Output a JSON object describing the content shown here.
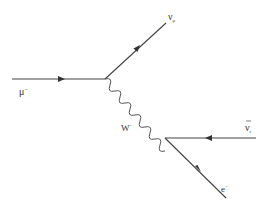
{
  "diagram": {
    "type": "feynman",
    "particles": {
      "muon": {
        "label": "μ",
        "sup": "−"
      },
      "muon_neutrino": {
        "label": "ν",
        "sub": "μ"
      },
      "w_boson": {
        "label": "W",
        "sup": "−"
      },
      "electron_antineutrino": {
        "label": "ν",
        "sub": "e",
        "bar": true
      },
      "electron": {
        "label": "e",
        "sup": "−"
      }
    },
    "colors": {
      "line": "#333333",
      "background": "#ffffff"
    }
  }
}
